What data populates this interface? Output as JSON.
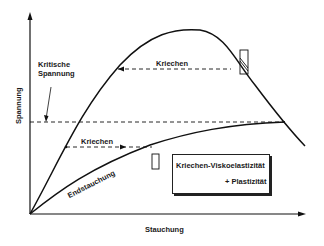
{
  "diagram": {
    "y_axis_label": "Spannung",
    "x_axis_label": "Stauchung",
    "critical_label_line1": "Kritische",
    "critical_label_line2": "Spannung",
    "creep_upper_label": "Kriechen",
    "creep_lower_label": "Kriechen",
    "end_strain_label": "Endstauchung",
    "legend_line1": "Kriechen-Viskoelastizität",
    "legend_line2": "+ Plastizität",
    "line_color": "#111111"
  }
}
